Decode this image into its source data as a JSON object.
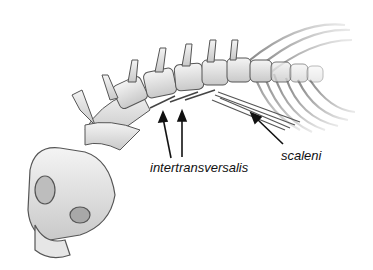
{
  "figure": {
    "labels": [
      {
        "id": "intertransversalis",
        "text": "intertransversalis"
      },
      {
        "id": "scaleni",
        "text": "scaleni"
      }
    ]
  }
}
